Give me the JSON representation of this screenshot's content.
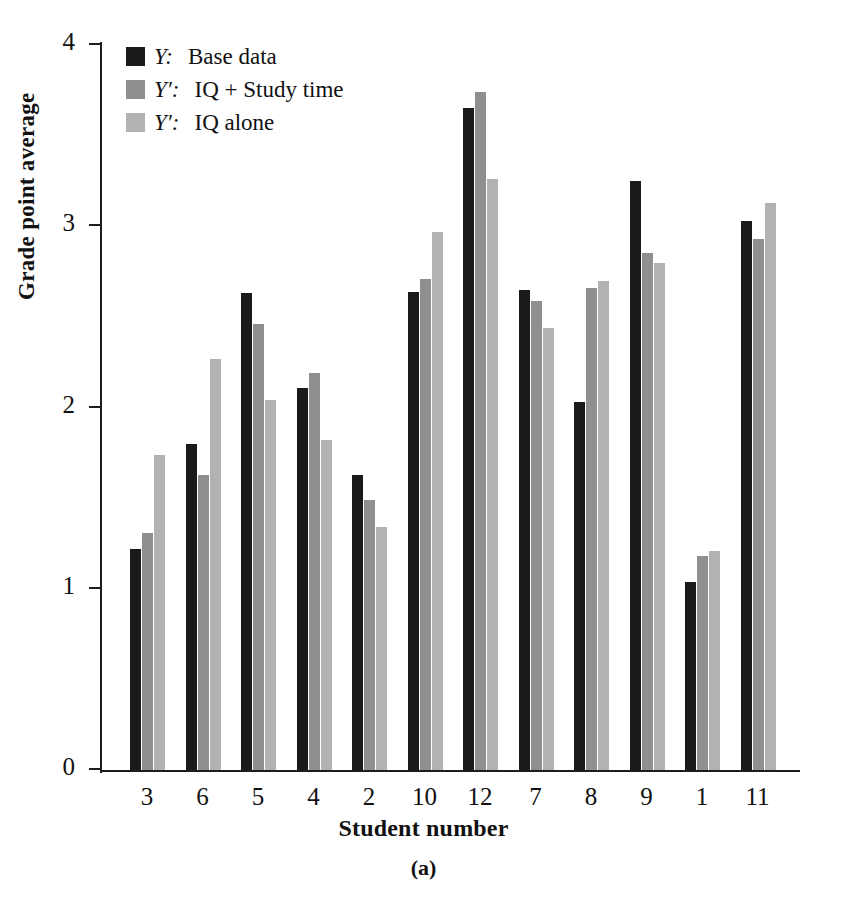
{
  "chart_data": {
    "type": "bar",
    "title": "",
    "subtitle": "",
    "caption": "(a)",
    "xlabel": "Student number",
    "ylabel": "Grade point average",
    "categories": [
      "3",
      "6",
      "5",
      "4",
      "2",
      "10",
      "12",
      "7",
      "8",
      "9",
      "1",
      "11"
    ],
    "series": [
      {
        "name": "Y:  Base data",
        "key": "Y",
        "key_suffix": ":",
        "label": "Base data",
        "color": "#1a1a1a",
        "values": [
          1.22,
          1.8,
          2.63,
          2.11,
          1.63,
          2.64,
          3.65,
          2.65,
          2.03,
          3.25,
          1.04,
          3.03
        ]
      },
      {
        "name": "Y':  IQ + Study time",
        "key": "Y′",
        "key_suffix": ":",
        "label": "IQ + Study time",
        "color": "#8f8f8f",
        "values": [
          1.31,
          1.63,
          2.46,
          2.19,
          1.49,
          2.71,
          3.74,
          2.59,
          2.66,
          2.85,
          1.18,
          2.93
        ]
      },
      {
        "name": "Y':  IQ alone",
        "key": "Y′",
        "key_suffix": ":",
        "label": "IQ alone",
        "color": "#b2b2b2",
        "values": [
          1.74,
          2.27,
          2.04,
          1.82,
          1.34,
          2.97,
          3.26,
          2.44,
          2.7,
          2.8,
          1.21,
          3.13
        ]
      }
    ],
    "ylim": [
      0,
      4
    ],
    "yticks": [
      "0",
      "1",
      "2",
      "3",
      "4"
    ],
    "ytick_values": [
      0,
      1,
      2,
      3,
      4
    ],
    "grid": false,
    "legend_position": "top-left",
    "axis_color": "#1d1d1d",
    "background": "#ffffff"
  }
}
